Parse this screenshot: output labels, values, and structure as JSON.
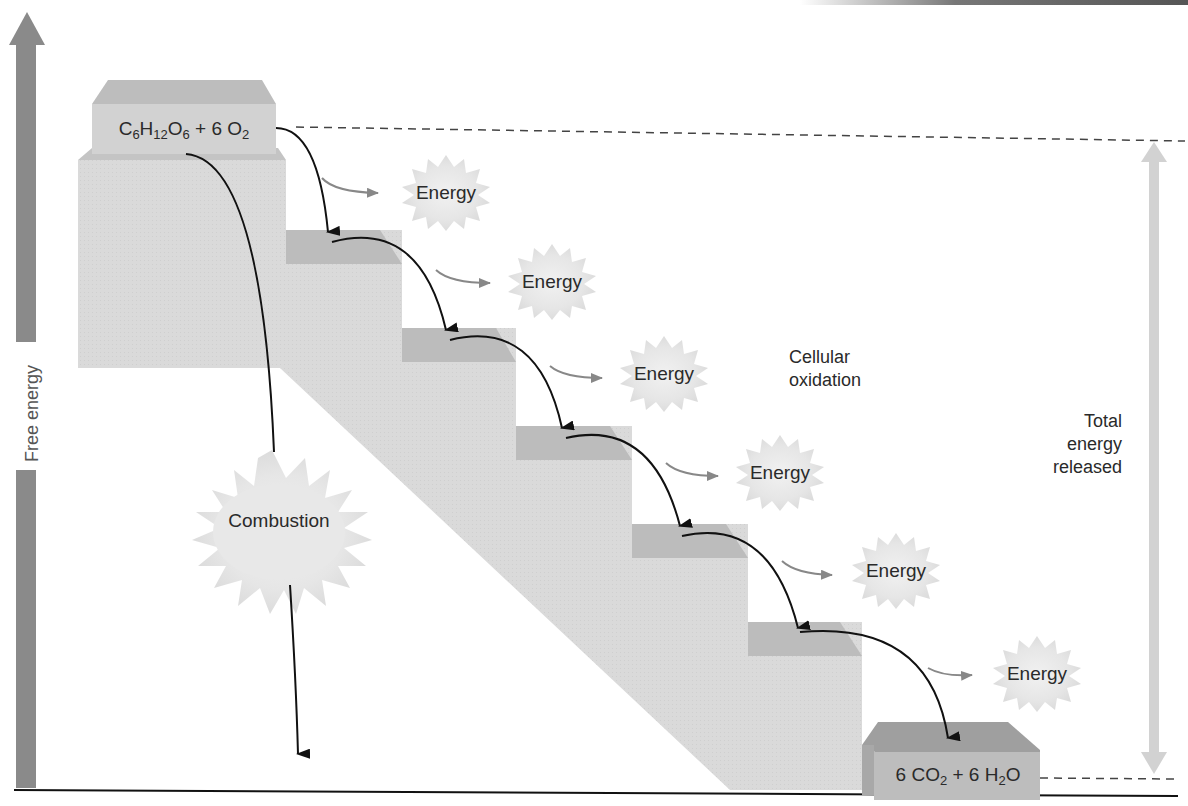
{
  "diagram": {
    "y_axis_label": "Free energy",
    "start_compound": {
      "parts": [
        "C",
        "6",
        "H",
        "12",
        "O",
        "6",
        " + 6 O",
        "2"
      ],
      "text": "C6H12O6 + 6 O2"
    },
    "end_compound": {
      "parts": [
        "6 CO",
        "2",
        " + 6 H",
        "2",
        "O"
      ],
      "text": "6 CO2 + 6 H2O"
    },
    "combustion_label": "Combustion",
    "cellular_label_lines": [
      "Cellular",
      "oxidation"
    ],
    "total_label_lines": [
      "Total",
      "energy",
      "released"
    ],
    "energy_labels": [
      "Energy",
      "Energy",
      "Energy",
      "Energy",
      "Energy",
      "Energy"
    ],
    "steps_count": 7,
    "colors": {
      "block_face": "#d8d8d8",
      "block_top": "#b9b9b9",
      "end_block": "#bdbdbd",
      "axis_arrow": "#8a8a8a",
      "total_arrow": "#d2d2d2",
      "burst": "#e4e4e4",
      "line": "#111111"
    }
  }
}
